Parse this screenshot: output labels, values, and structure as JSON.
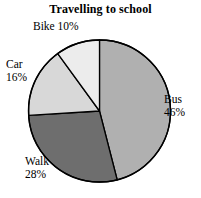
{
  "chart_data": {
    "type": "pie",
    "title": "Travelling to school",
    "categories": [
      "Bus",
      "Walk",
      "Car",
      "Bike"
    ],
    "values": [
      46,
      28,
      16,
      10
    ],
    "value_unit": "%",
    "labels": [
      {
        "name": "Bus",
        "percent": "46%",
        "color": "#b0b0b0"
      },
      {
        "name": "Walk",
        "percent": "28%",
        "color": "#6e6e6e"
      },
      {
        "name": "Car",
        "percent": "16%",
        "color": "#d8d8d8"
      },
      {
        "name": "Bike",
        "percent": "10%",
        "color": "#ececec"
      }
    ],
    "legend": "none",
    "grid": false,
    "start_angle_deg": 0,
    "direction": "clockwise",
    "outline_color": "#000000"
  },
  "title": {
    "text": "Travelling to school"
  },
  "slices": {
    "bike": {
      "label": "Bike 10%",
      "name": "Bike",
      "percent": "10%",
      "color": "#ececec"
    },
    "car": {
      "name": "Car",
      "percent": "16%",
      "color": "#d8d8d8"
    },
    "bus": {
      "name": "Bus",
      "percent": "46%",
      "color": "#b0b0b0"
    },
    "walk": {
      "name": "Walk",
      "percent": "28%",
      "color": "#6e6e6e"
    }
  }
}
